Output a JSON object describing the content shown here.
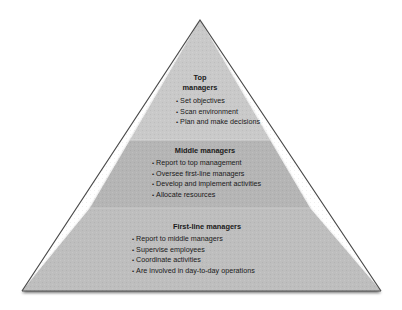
{
  "diagram": {
    "type": "pyramid",
    "colors": {
      "top_fill": "#c9c9c9",
      "middle_fill": "#b4b4b4",
      "bottom_fill": "#bdbdbd",
      "outline": "#3a3a3a",
      "text": "#1a1a1a"
    },
    "tiers": [
      {
        "title_line1": "Top",
        "title_line2": "managers",
        "bullets": [
          "Set objectives",
          "Scan environment",
          "Plan and make decisions"
        ]
      },
      {
        "title": "Middle managers",
        "bullets": [
          "Report to top management",
          "Oversee first-line managers",
          "Develop and implement activities",
          "Allocate resources"
        ]
      },
      {
        "title": "First-line managers",
        "bullets": [
          "Report to middle managers",
          "Supervise employees",
          "Coordinate activities",
          "Are involved in day-to-day operations"
        ]
      }
    ]
  }
}
